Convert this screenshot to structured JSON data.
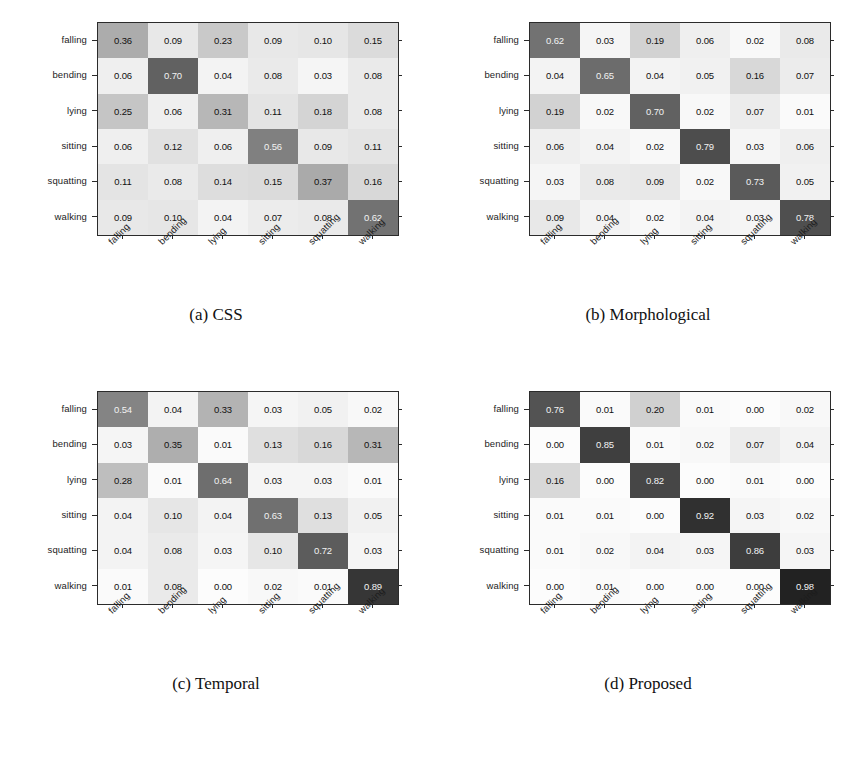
{
  "figure": {
    "classes": [
      "falling",
      "bending",
      "lying",
      "sitting",
      "squatting",
      "walking"
    ],
    "colormap": "inverted-grayscale",
    "panels": [
      {
        "tag": "(a)",
        "caption": "(a)  CSS"
      },
      {
        "tag": "(b)",
        "caption": "(b)  Morphological"
      },
      {
        "tag": "(c)",
        "caption": "(c)  Temporal"
      },
      {
        "tag": "(d)",
        "caption": "(d)  Proposed"
      }
    ]
  },
  "chart_data": [
    {
      "type": "heatmap",
      "subtype": "confusion-matrix",
      "title": "(a)  CSS",
      "xlabel": "",
      "ylabel": "",
      "grid": false,
      "legend": "none",
      "colormap": "gray_r",
      "vmin": 0.0,
      "vmax": 1.0,
      "categories": [
        "falling",
        "bending",
        "lying",
        "sitting",
        "squatting",
        "walking"
      ],
      "x": [
        "falling",
        "bending",
        "lying",
        "sitting",
        "squatting",
        "walking"
      ],
      "y": [
        "falling",
        "bending",
        "lying",
        "sitting",
        "squatting",
        "walking"
      ],
      "values": [
        [
          "0.36",
          "0.09",
          "0.23",
          "0.09",
          "0.10",
          "0.15"
        ],
        [
          "0.06",
          "0.70",
          "0.04",
          "0.08",
          "0.03",
          "0.08"
        ],
        [
          "0.25",
          "0.06",
          "0.31",
          "0.11",
          "0.18",
          "0.08"
        ],
        [
          "0.06",
          "0.12",
          "0.06",
          "0.56",
          "0.09",
          "0.11"
        ],
        [
          "0.11",
          "0.08",
          "0.14",
          "0.15",
          "0.37",
          "0.16"
        ],
        [
          "0.09",
          "0.10",
          "0.04",
          "0.07",
          "0.08",
          "0.62"
        ]
      ]
    },
    {
      "type": "heatmap",
      "subtype": "confusion-matrix",
      "title": "(b)  Morphological",
      "xlabel": "",
      "ylabel": "",
      "grid": false,
      "legend": "none",
      "colormap": "gray_r",
      "vmin": 0.0,
      "vmax": 1.0,
      "categories": [
        "falling",
        "bending",
        "lying",
        "sitting",
        "squatting",
        "walking"
      ],
      "x": [
        "falling",
        "bending",
        "lying",
        "sitting",
        "squatting",
        "walking"
      ],
      "y": [
        "falling",
        "bending",
        "lying",
        "sitting",
        "squatting",
        "walking"
      ],
      "values": [
        [
          "0.62",
          "0.03",
          "0.19",
          "0.06",
          "0.02",
          "0.08"
        ],
        [
          "0.04",
          "0.65",
          "0.04",
          "0.05",
          "0.16",
          "0.07"
        ],
        [
          "0.19",
          "0.02",
          "0.70",
          "0.02",
          "0.07",
          "0.01"
        ],
        [
          "0.06",
          "0.04",
          "0.02",
          "0.79",
          "0.03",
          "0.06"
        ],
        [
          "0.03",
          "0.08",
          "0.09",
          "0.02",
          "0.73",
          "0.05"
        ],
        [
          "0.09",
          "0.04",
          "0.02",
          "0.04",
          "0.03",
          "0.78"
        ]
      ]
    },
    {
      "type": "heatmap",
      "subtype": "confusion-matrix",
      "title": "(c)  Temporal",
      "xlabel": "",
      "ylabel": "",
      "grid": false,
      "legend": "none",
      "colormap": "gray_r",
      "vmin": 0.0,
      "vmax": 1.0,
      "categories": [
        "falling",
        "bending",
        "lying",
        "sitting",
        "squatting",
        "walking"
      ],
      "x": [
        "falling",
        "bending",
        "lying",
        "sitting",
        "squatting",
        "walking"
      ],
      "y": [
        "falling",
        "bending",
        "lying",
        "sitting",
        "squatting",
        "walking"
      ],
      "values": [
        [
          "0.54",
          "0.04",
          "0.33",
          "0.03",
          "0.05",
          "0.02"
        ],
        [
          "0.03",
          "0.35",
          "0.01",
          "0.13",
          "0.16",
          "0.31"
        ],
        [
          "0.28",
          "0.01",
          "0.64",
          "0.03",
          "0.03",
          "0.01"
        ],
        [
          "0.04",
          "0.10",
          "0.04",
          "0.63",
          "0.13",
          "0.05"
        ],
        [
          "0.04",
          "0.08",
          "0.03",
          "0.10",
          "0.72",
          "0.03"
        ],
        [
          "0.01",
          "0.08",
          "0.00",
          "0.02",
          "0.01",
          "0.89"
        ]
      ]
    },
    {
      "type": "heatmap",
      "subtype": "confusion-matrix",
      "title": "(d)  Proposed",
      "xlabel": "",
      "ylabel": "",
      "grid": false,
      "legend": "none",
      "colormap": "gray_r",
      "vmin": 0.0,
      "vmax": 1.0,
      "categories": [
        "falling",
        "bending",
        "lying",
        "sitting",
        "squatting",
        "walking"
      ],
      "x": [
        "falling",
        "bending",
        "lying",
        "sitting",
        "squatting",
        "walking"
      ],
      "y": [
        "falling",
        "bending",
        "lying",
        "sitting",
        "squatting",
        "walking"
      ],
      "values": [
        [
          "0.76",
          "0.01",
          "0.20",
          "0.01",
          "0.00",
          "0.02"
        ],
        [
          "0.00",
          "0.85",
          "0.01",
          "0.02",
          "0.07",
          "0.04"
        ],
        [
          "0.16",
          "0.00",
          "0.82",
          "0.00",
          "0.01",
          "0.00"
        ],
        [
          "0.01",
          "0.01",
          "0.00",
          "0.92",
          "0.03",
          "0.02"
        ],
        [
          "0.01",
          "0.02",
          "0.04",
          "0.03",
          "0.86",
          "0.03"
        ],
        [
          "0.00",
          "0.01",
          "0.00",
          "0.00",
          "0.00",
          "0.98"
        ]
      ]
    }
  ]
}
